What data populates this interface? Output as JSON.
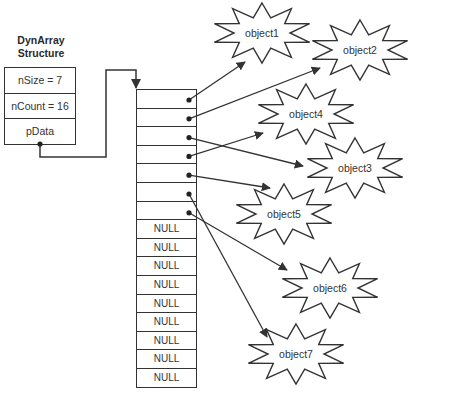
{
  "title": "DynArray Structure",
  "struct": {
    "title_line1": "DynArray",
    "title_line2": "Structure",
    "fields": [
      "nSize = 7",
      "nCount = 16",
      "pData"
    ]
  },
  "array": {
    "cells": [
      "",
      "",
      "",
      "",
      "",
      "",
      "",
      "NULL",
      "NULL",
      "NULL",
      "NULL",
      "NULL",
      "NULL",
      "NULL",
      "NULL",
      "NULL"
    ],
    "pointer_targets": [
      "object1",
      "object2",
      "object3",
      "object4",
      "object5",
      "object7",
      "object6"
    ]
  },
  "objects": [
    {
      "id": "object1",
      "label": "object1"
    },
    {
      "id": "object2",
      "label": "object2"
    },
    {
      "id": "object3",
      "label": "object3"
    },
    {
      "id": "object4",
      "label": "object4"
    },
    {
      "id": "object5",
      "label": "object5"
    },
    {
      "id": "object6",
      "label": "object6"
    },
    {
      "id": "object7",
      "label": "object7"
    }
  ],
  "colors": {
    "stroke": "#333333",
    "background": "#ffffff"
  }
}
